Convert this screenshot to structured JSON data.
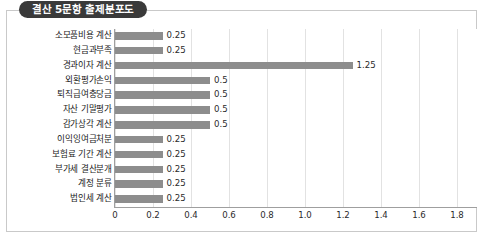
{
  "title": "결산 5문항 출제분포도",
  "colors": {
    "bar": "#8d8d8d",
    "badge_bg": "#3a3a3a",
    "badge_text": "#ffffff",
    "gridline": "#e2e2e2",
    "axis": "#9f9f9f",
    "frame": "#c9c9c9"
  },
  "chart_data": {
    "type": "bar",
    "orientation": "horizontal",
    "title": "결산 5문항 출제분포도",
    "xlabel": "",
    "ylabel": "",
    "xlim": [
      0,
      1.9
    ],
    "grid": true,
    "legend": "none",
    "xticks": [
      "0",
      "0.2",
      "0.4",
      "0.6",
      "0.8",
      "1.0",
      "1.2",
      "1.4",
      "1.6",
      "1.8"
    ],
    "xtick_values": [
      0,
      0.2,
      0.4,
      0.6,
      0.8,
      1.0,
      1.2,
      1.4,
      1.6,
      1.8
    ],
    "categories": [
      "소모품비용 계산",
      "현금과부족",
      "경과이자 계산",
      "외환평가손익",
      "퇴직급여충당금",
      "자산 기말평가",
      "감가상각 계산",
      "이익잉여금처분",
      "보험료 기간 계산",
      "부가세 결산분개",
      "계정 분류",
      "법인세 계산"
    ],
    "values": [
      0.25,
      0.25,
      1.25,
      0.5,
      0.5,
      0.5,
      0.5,
      0.25,
      0.25,
      0.25,
      0.25,
      0.25
    ],
    "value_labels": [
      "0.25",
      "0.25",
      "1.25",
      "0.5",
      "0.5",
      "0.5",
      "0.5",
      "0.25",
      "0.25",
      "0.25",
      "0.25",
      "0.25"
    ]
  }
}
